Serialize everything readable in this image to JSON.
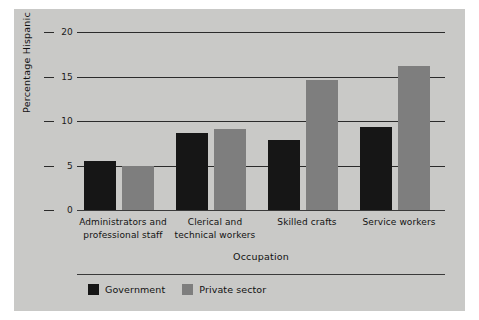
{
  "chart_data": {
    "type": "bar",
    "title": "",
    "xlabel": "Occupation",
    "ylabel": "Percentage Hispanic",
    "ylim": [
      0,
      20
    ],
    "yticks": [
      0,
      5,
      10,
      15,
      20
    ],
    "ytick_labels": [
      "0",
      "5",
      "10",
      "15",
      "20"
    ],
    "grid": true,
    "legend_position": "bottom-left",
    "categories": [
      "Administrators and professional staff",
      "Clerical and technical workers",
      "Skilled crafts",
      "Service workers"
    ],
    "category_lines": [
      [
        "Administrators and",
        "professional staff"
      ],
      [
        "Clerical and",
        "technical workers"
      ],
      [
        "Skilled crafts"
      ],
      [
        "Service workers"
      ]
    ],
    "series": [
      {
        "name": "Government",
        "color": "#161616",
        "values": [
          5.5,
          8.7,
          7.9,
          9.3
        ]
      },
      {
        "name": "Private sector",
        "color": "#7e7e7e",
        "values": [
          5.0,
          9.1,
          14.6,
          16.2
        ]
      }
    ]
  },
  "figure": {
    "background": "#c9c9c7",
    "page_background": "#ffffff"
  }
}
